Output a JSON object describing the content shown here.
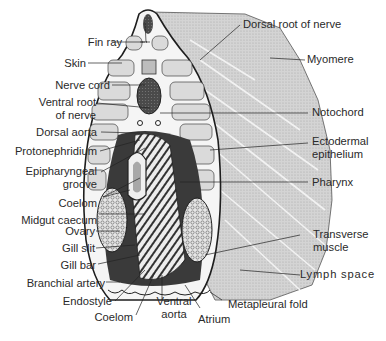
{
  "figure": {
    "colors": {
      "background": "#ffffff",
      "myomere_fill": "#cfcfcf",
      "myomere_light": "#dcdcdc",
      "outline": "#1e1e1e",
      "dark_tissue": "#3a3a3a",
      "label_text": "#2a2a2a"
    }
  },
  "labels": {
    "left": [
      {
        "id": "fin_ray",
        "text": "Fin ray"
      },
      {
        "id": "skin",
        "text": "Skin"
      },
      {
        "id": "nerve_cord",
        "text": "Nerve cord"
      },
      {
        "id": "ventral_root_1",
        "text": "Ventral root"
      },
      {
        "id": "ventral_root_2",
        "text": "of nerve"
      },
      {
        "id": "dorsal_aorta",
        "text": "Dorsal aorta"
      },
      {
        "id": "protonephridium",
        "text": "Protonephridium"
      },
      {
        "id": "epipharyngeal_1",
        "text": "Epipharyngeal"
      },
      {
        "id": "epipharyngeal_2",
        "text": "groove"
      },
      {
        "id": "coelom_upper",
        "text": "Coelom"
      },
      {
        "id": "midgut_caecum",
        "text": "Midgut caecum"
      },
      {
        "id": "ovary",
        "text": "Ovary"
      },
      {
        "id": "gill_slit",
        "text": "Gill slit"
      },
      {
        "id": "gill_bar",
        "text": "Gill bar"
      },
      {
        "id": "branchial_artery",
        "text": "Branchial artery"
      },
      {
        "id": "endostyle",
        "text": "Endostyle"
      },
      {
        "id": "coelom_lower",
        "text": "Coelom"
      }
    ],
    "bottom": [
      {
        "id": "ventral_aorta_1",
        "text": "Ventral"
      },
      {
        "id": "ventral_aorta_2",
        "text": "aorta"
      },
      {
        "id": "atrium",
        "text": "Atrium"
      },
      {
        "id": "metapleural_fold",
        "text": "Metapleural fold"
      }
    ],
    "right": [
      {
        "id": "dorsal_root",
        "text": "Dorsal root of nerve"
      },
      {
        "id": "myomere",
        "text": "Myomere"
      },
      {
        "id": "notochord",
        "text": "Notochord"
      },
      {
        "id": "ectodermal_1",
        "text": "Ectodermal"
      },
      {
        "id": "ectodermal_2",
        "text": "epithelium"
      },
      {
        "id": "pharynx",
        "text": "Pharynx"
      },
      {
        "id": "transverse_1",
        "text": "Transverse"
      },
      {
        "id": "transverse_2",
        "text": "muscle"
      },
      {
        "id": "lymph_space",
        "text": "Lymph  space"
      }
    ]
  }
}
